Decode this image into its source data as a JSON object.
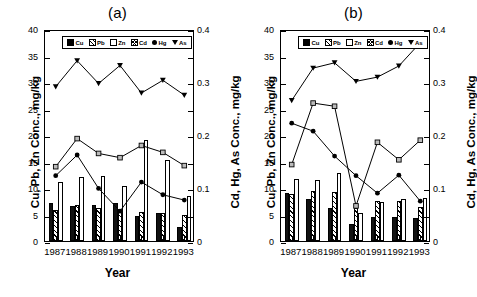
{
  "figure": {
    "x_axis_title": "Year",
    "y_axis_title_left": "Cu, Pb, Zn Conc., mg/kg",
    "y_axis_title_right": "Cd, Hg, As Conc., mg/kg",
    "legend_labels": {
      "cu": "Cu",
      "pb": "Pb",
      "zn": "Zn",
      "cd": "Cd",
      "hg": "Hg",
      "as": "As"
    },
    "panel_a_title": "(a)",
    "panel_b_title": "(b)",
    "y_left_ticks": [
      "0",
      "5",
      "10",
      "15",
      "20",
      "25",
      "30",
      "35",
      "40"
    ],
    "y_right_ticks": [
      "0",
      "0.1",
      "0.2",
      "0.3",
      "0.4"
    ],
    "x_ticks": [
      "1987",
      "1988",
      "1989",
      "1990",
      "1991",
      "1992",
      "1993"
    ]
  },
  "chart_data": [
    {
      "type": "bar",
      "title": "(a)",
      "xlabel": "Year",
      "ylabel": "Cu, Pb, Zn Conc., mg/kg",
      "ylabel_right": "Cd, Hg, As Conc., mg/kg",
      "ylim": [
        0,
        40
      ],
      "ylim_right": [
        0,
        0.4
      ],
      "grid": false,
      "legend_position": "top-center-inside",
      "categories": [
        "1987",
        "1988",
        "1989",
        "1990",
        "1991",
        "1992",
        "1993"
      ],
      "series": [
        {
          "name": "Cu",
          "kind": "bar",
          "axis": "left",
          "values": [
            7.1,
            6.7,
            6.8,
            7.2,
            4.8,
            5.2,
            2.7
          ]
        },
        {
          "name": "Pb",
          "kind": "bar",
          "axis": "left",
          "values": [
            5.9,
            6.8,
            6.3,
            5.9,
            5.4,
            5.3,
            5.0
          ]
        },
        {
          "name": "Zn",
          "kind": "bar",
          "axis": "left",
          "values": [
            11.2,
            12.0,
            12.2,
            10.4,
            19.0,
            15.2,
            8.5
          ]
        },
        {
          "name": "Cd",
          "kind": "line",
          "axis": "right",
          "values": [
            0.144,
            0.197,
            0.169,
            0.161,
            0.184,
            0.171,
            0.146
          ]
        },
        {
          "name": "Hg",
          "kind": "line",
          "axis": "right",
          "values": [
            0.127,
            0.166,
            0.103,
            0.06,
            0.115,
            0.091,
            0.081
          ]
        },
        {
          "name": "As",
          "kind": "line",
          "axis": "right",
          "values": [
            0.295,
            0.344,
            0.301,
            0.335,
            0.283,
            0.307,
            0.279
          ]
        }
      ]
    },
    {
      "type": "bar",
      "title": "(b)",
      "xlabel": "Year",
      "ylabel": "Cu, Pb, Zn Conc., mg/kg",
      "ylabel_right": "Cd, Hg, As Conc., mg/kg",
      "ylim": [
        0,
        40
      ],
      "ylim_right": [
        0,
        0.4
      ],
      "grid": false,
      "legend_position": "top-center-inside",
      "categories": [
        "1987",
        "1988",
        "1989",
        "1990",
        "1991",
        "1992",
        "1993"
      ],
      "series": [
        {
          "name": "Cu",
          "kind": "bar",
          "axis": "left",
          "values": [
            9.0,
            7.9,
            6.2,
            3.2,
            4.5,
            4.6,
            4.3
          ]
        },
        {
          "name": "Pb",
          "kind": "bar",
          "axis": "left",
          "values": [
            8.8,
            9.5,
            9.2,
            6.2,
            7.6,
            7.6,
            6.4
          ]
        },
        {
          "name": "Zn",
          "kind": "bar",
          "axis": "left",
          "values": [
            11.7,
            11.6,
            12.9,
            5.3,
            7.3,
            7.9,
            8.2
          ]
        },
        {
          "name": "Cd",
          "kind": "line",
          "axis": "right",
          "values": [
            0.148,
            0.264,
            0.258,
            0.07,
            0.19,
            0.157,
            0.194
          ]
        },
        {
          "name": "Hg",
          "kind": "line",
          "axis": "right",
          "values": [
            0.226,
            0.211,
            0.164,
            0.127,
            0.094,
            0.128,
            0.079
          ]
        },
        {
          "name": "As",
          "kind": "line",
          "axis": "right",
          "values": [
            0.269,
            0.33,
            0.34,
            0.305,
            0.313,
            0.334,
            0.378
          ]
        }
      ]
    }
  ]
}
